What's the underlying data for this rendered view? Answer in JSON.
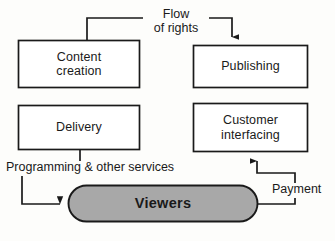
{
  "diagram": {
    "colors": {
      "stroke": "#1a1a1a",
      "pill_fill": "#a8a8a8",
      "background": "#fdfdfb",
      "text": "#1a1a1a"
    },
    "nodes": [
      {
        "id": "content-creation",
        "label": "Content\ncreation",
        "shape": "rect"
      },
      {
        "id": "publishing",
        "label": "Publishing",
        "shape": "rect"
      },
      {
        "id": "delivery",
        "label": "Delivery",
        "shape": "rect"
      },
      {
        "id": "customer-interfacing",
        "label": "Customer\ninterfacing",
        "shape": "rect"
      },
      {
        "id": "viewers",
        "label": "Viewers",
        "shape": "pill"
      }
    ],
    "edges": [
      {
        "id": "flow-of-rights",
        "label": "Flow\nof rights",
        "from": "content-creation",
        "to": "publishing",
        "arrow": true
      },
      {
        "id": "programming-other-services",
        "label": "Programming & other services",
        "from": "delivery",
        "to": "viewers",
        "arrow": true
      },
      {
        "id": "payment",
        "label": "Payment",
        "from": "viewers",
        "to": "customer-interfacing",
        "arrow": true
      }
    ]
  }
}
